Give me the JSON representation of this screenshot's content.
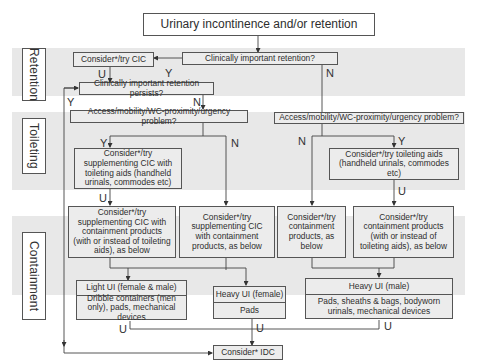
{
  "title": "Urinary incontinence and/or retention",
  "sections": [
    {
      "name": "retention",
      "label": "Retention"
    },
    {
      "name": "toileting",
      "label": "Toileting"
    },
    {
      "name": "containment",
      "label": "Containment"
    }
  ],
  "nodes": {
    "clinically_important_retention": "Clinically important retention?",
    "consider_cic": "Consider*/try CIC",
    "retention_persists": "Clinically important retention persists?",
    "access_problem_left": "Access/mobility/WC-proximity/urgency problem?",
    "access_problem_right": "Access/mobility/WC-proximity/urgency problem?",
    "cic_toileting_aids": "Consider*/try supplementing CIC with toileting aids (handheld urinals, commodes etc)",
    "toileting_aids": "Consider*/try toileting aids (handheld urinals, commodes etc)",
    "cic_containment_with_or_instead": "Consider*/try supplementing CIC with containment products (with or instead of toileting aids), as below",
    "cic_containment": "Consider*/try supplementing CIC with containment products, as below",
    "containment": "Consider*/try containment products, as below",
    "containment_with_or_instead": "Consider*/try containment products (with or instead of toileting aids), as below",
    "light_ui": {
      "header": "Light UI (female & male)",
      "body": "Dribble containers (men only), pads, mechanical devices"
    },
    "heavy_ui_female": {
      "header": "Heavy UI (female)",
      "body": "Pads"
    },
    "heavy_ui_male": {
      "header": "Heavy UI (male)",
      "body": "Pads, sheaths & bags, bodyworn urinals, mechanical devices"
    },
    "consider_idc": "Consider* IDC"
  },
  "edge_labels": {
    "yes": "Y",
    "no": "N",
    "unsuccessful": "U"
  },
  "colors": {
    "band": "#e8e8e8",
    "box_fill": "#ececec",
    "border": "#555555",
    "text": "#333333"
  }
}
